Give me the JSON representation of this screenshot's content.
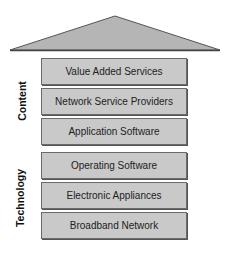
{
  "diagram": {
    "roof": {
      "fill": "#b5b5b5",
      "stroke": "#555555"
    },
    "groups": [
      {
        "label": "Content",
        "layers": [
          "Value Added Services",
          "Network Service Providers",
          "Application Software"
        ]
      },
      {
        "label": "Technology",
        "layers": [
          "Operating Software",
          "Electronic Appliances",
          "Broadband Network"
        ]
      }
    ]
  }
}
